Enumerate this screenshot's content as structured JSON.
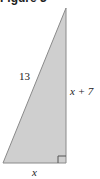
{
  "figure": {
    "title": "Figure 3"
  },
  "triangle": {
    "vertices": {
      "apex": [
        66,
        8
      ],
      "bottom_left": [
        3,
        163
      ],
      "bottom_right": [
        66,
        163
      ]
    },
    "fill": "#cfcfcf",
    "stroke": "#8a8a8a",
    "right_angle_at": "bottom_right"
  },
  "labels": {
    "hypotenuse": "13",
    "vertical_leg": "x + 7",
    "horizontal_leg": "x"
  }
}
